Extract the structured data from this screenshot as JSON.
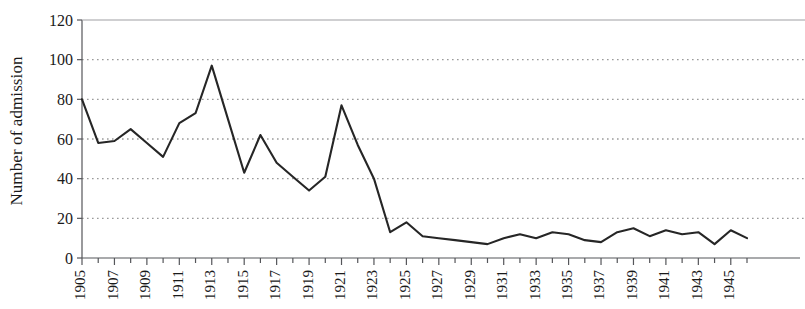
{
  "chart_data": {
    "type": "line",
    "title": "",
    "xlabel": "",
    "ylabel": "Number of admission",
    "xlim": [
      1905,
      1946
    ],
    "ylim": [
      0,
      120
    ],
    "ytick_values": [
      0,
      20,
      40,
      60,
      80,
      100,
      120
    ],
    "ytick_labels": [
      "0",
      "20",
      "40",
      "60",
      "80",
      "100",
      "120"
    ],
    "xtick_labels": [
      "1905",
      "1907",
      "1909",
      "1911",
      "1913",
      "1915",
      "1917",
      "1919",
      "1921",
      "1923",
      "1925",
      "1927",
      "1929",
      "1931",
      "1933",
      "1935",
      "1937",
      "1939",
      "1941",
      "1943",
      "1945"
    ],
    "xtick_label_years": [
      1905,
      1907,
      1909,
      1911,
      1913,
      1915,
      1917,
      1919,
      1921,
      1923,
      1925,
      1927,
      1929,
      1931,
      1933,
      1935,
      1937,
      1939,
      1941,
      1943,
      1945
    ],
    "minor_tick_years": [
      1905,
      1906,
      1907,
      1908,
      1909,
      1910,
      1911,
      1912,
      1913,
      1914,
      1915,
      1916,
      1917,
      1918,
      1919,
      1920,
      1921,
      1922,
      1923,
      1924,
      1925,
      1926,
      1927,
      1928,
      1929,
      1930,
      1931,
      1932,
      1933,
      1934,
      1935,
      1936,
      1937,
      1938,
      1939,
      1940,
      1941,
      1942,
      1943,
      1944,
      1945,
      1946
    ],
    "grid": true,
    "grid_style": "dotted",
    "grid_color": "#9a9a9a",
    "line_color": "#262626",
    "legend": "none",
    "x": [
      1905,
      1906,
      1907,
      1908,
      1909,
      1910,
      1911,
      1912,
      1913,
      1914,
      1915,
      1916,
      1917,
      1918,
      1919,
      1920,
      1921,
      1922,
      1923,
      1924,
      1925,
      1926,
      1927,
      1928,
      1929,
      1930,
      1931,
      1932,
      1933,
      1934,
      1935,
      1936,
      1937,
      1938,
      1939,
      1940,
      1941,
      1942,
      1943,
      1944,
      1945,
      1946
    ],
    "values": [
      80,
      58,
      59,
      65,
      58,
      51,
      68,
      73,
      97,
      70,
      43,
      62,
      48,
      41,
      34,
      41,
      77,
      57,
      40,
      13,
      18,
      11,
      10,
      9,
      8,
      7,
      10,
      12,
      10,
      13,
      12,
      9,
      8,
      13,
      15,
      11,
      14,
      12,
      13,
      7,
      14,
      10
    ],
    "series": [
      {
        "name": "Number of admission",
        "values": [
          80,
          58,
          59,
          65,
          58,
          51,
          68,
          73,
          97,
          70,
          43,
          62,
          48,
          41,
          34,
          41,
          77,
          57,
          40,
          13,
          18,
          11,
          10,
          9,
          8,
          7,
          10,
          12,
          10,
          13,
          12,
          9,
          8,
          13,
          15,
          11,
          14,
          12,
          13,
          7,
          14,
          10
        ]
      }
    ]
  }
}
